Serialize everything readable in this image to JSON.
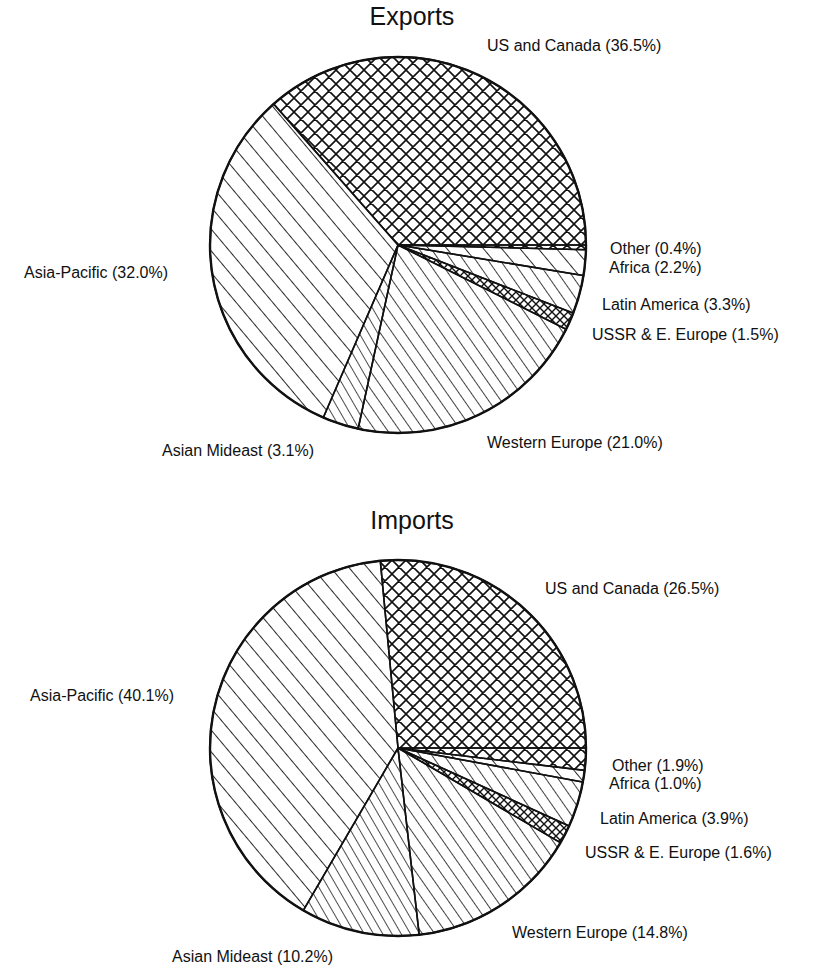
{
  "chart_data": [
    {
      "type": "pie",
      "title": "Exports",
      "slices": [
        {
          "label": "US and Canada",
          "value": 36.5,
          "display": "US and Canada (36.5%)",
          "pattern": "crosshatch"
        },
        {
          "label": "Other",
          "value": 0.4,
          "display": "Other (0.4%)",
          "pattern": "crosshatch"
        },
        {
          "label": "Africa",
          "value": 2.2,
          "display": "Africa (2.2%)",
          "pattern": "diag-wide"
        },
        {
          "label": "Latin America",
          "value": 3.3,
          "display": "Latin America (3.3%)",
          "pattern": "diag-medium"
        },
        {
          "label": "USSR & E. Europe",
          "value": 1.5,
          "display": "USSR & E. Europe (1.5%)",
          "pattern": "crosshatch-dense"
        },
        {
          "label": "Western Europe",
          "value": 21.0,
          "display": "Western Europe (21.0%)",
          "pattern": "diag-medium"
        },
        {
          "label": "Asian Mideast",
          "value": 3.1,
          "display": "Asian Mideast (3.1%)",
          "pattern": "diag-dense"
        },
        {
          "label": "Asia-Pacific",
          "value": 32.0,
          "display": "Asia-Pacific (32.0%)",
          "pattern": "diag-wide"
        }
      ]
    },
    {
      "type": "pie",
      "title": "Imports",
      "slices": [
        {
          "label": "US and Canada",
          "value": 26.5,
          "display": "US and Canada (26.5%)",
          "pattern": "crosshatch"
        },
        {
          "label": "Other",
          "value": 1.9,
          "display": "Other (1.9%)",
          "pattern": "crosshatch"
        },
        {
          "label": "Africa",
          "value": 1.0,
          "display": "Africa (1.0%)",
          "pattern": "diag-wide"
        },
        {
          "label": "Latin America",
          "value": 3.9,
          "display": "Latin America (3.9%)",
          "pattern": "diag-medium"
        },
        {
          "label": "USSR & E. Europe",
          "value": 1.6,
          "display": "USSR & E. Europe (1.6%)",
          "pattern": "crosshatch-dense"
        },
        {
          "label": "Western Europe",
          "value": 14.8,
          "display": "Western Europe (14.8%)",
          "pattern": "diag-medium"
        },
        {
          "label": "Asian Mideast",
          "value": 10.2,
          "display": "Asian Mideast (10.2%)",
          "pattern": "diag-dense"
        },
        {
          "label": "Asia-Pacific",
          "value": 40.1,
          "display": "Asia-Pacific (40.1%)",
          "pattern": "diag-wide"
        }
      ]
    }
  ],
  "charts": {
    "exports": {
      "title": "Exports",
      "labels": {
        "us_canada": "US and Canada (36.5%)",
        "other": "Other (0.4%)",
        "africa": "Africa (2.2%)",
        "latin_america": "Latin America (3.3%)",
        "ussr": "USSR & E. Europe (1.5%)",
        "western_europe": "Western Europe (21.0%)",
        "asian_mideast": "Asian Mideast (3.1%)",
        "asia_pacific": "Asia-Pacific (32.0%)"
      }
    },
    "imports": {
      "title": "Imports",
      "labels": {
        "us_canada": "US and Canada (26.5%)",
        "other": "Other (1.9%)",
        "africa": "Africa (1.0%)",
        "latin_america": "Latin America (3.9%)",
        "ussr": "USSR & E. Europe (1.6%)",
        "western_europe": "Western Europe (14.8%)",
        "asian_mideast": "Asian Mideast (10.2%)",
        "asia_pacific": "Asia-Pacific (40.1%)"
      }
    }
  },
  "style": {
    "ink": "#111111",
    "background": "#ffffff"
  }
}
